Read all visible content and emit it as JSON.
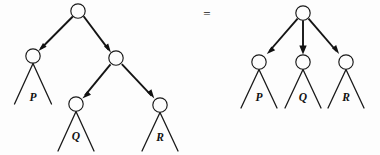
{
  "figure": {
    "background_color": "#fdfdfd",
    "ink_color": "#141414",
    "equals": {
      "text": "=",
      "x": 207,
      "y": 18
    },
    "left_tree": {
      "name": "binary-tree",
      "nodes": [
        {
          "id": "root",
          "label": "",
          "cx": 78,
          "cy": 11,
          "r": 7.2
        },
        {
          "id": "n-left",
          "label": "",
          "cx": 33,
          "cy": 56,
          "r": 7.2
        },
        {
          "id": "n-right",
          "label": "",
          "cx": 116,
          "cy": 58,
          "r": 7.2
        },
        {
          "id": "n-q",
          "label": "",
          "cx": 76,
          "cy": 104,
          "r": 7.2
        },
        {
          "id": "n-r",
          "label": "",
          "cx": 160,
          "cy": 105,
          "r": 7.2
        }
      ],
      "edges": [
        {
          "from": "root",
          "to": "n-left",
          "arrow": true
        },
        {
          "from": "root",
          "to": "n-right",
          "arrow": true
        },
        {
          "from": "n-right",
          "to": "n-q",
          "arrow": true
        },
        {
          "from": "n-right",
          "to": "n-r",
          "arrow": true
        }
      ],
      "subtrees": [
        {
          "label": "P",
          "apex_x": 33,
          "apex_y": 63,
          "base_y": 104,
          "half_width": 19,
          "label_x": 33,
          "label_y": 101
        },
        {
          "label": "Q",
          "apex_x": 76,
          "apex_y": 111,
          "base_y": 151,
          "half_width": 19,
          "label_x": 76,
          "label_y": 140
        },
        {
          "label": "R",
          "apex_x": 160,
          "apex_y": 112,
          "base_y": 151,
          "half_width": 19,
          "label_x": 160,
          "label_y": 141
        }
      ]
    },
    "right_tree": {
      "name": "multiway-tree",
      "nodes": [
        {
          "id": "root",
          "label": "",
          "cx": 303,
          "cy": 13,
          "r": 7.2
        },
        {
          "id": "c-p",
          "label": "",
          "cx": 259,
          "cy": 62,
          "r": 7.2
        },
        {
          "id": "c-q",
          "label": "",
          "cx": 303,
          "cy": 62,
          "r": 7.2
        },
        {
          "id": "c-r",
          "label": "",
          "cx": 346,
          "cy": 62,
          "r": 7.2
        }
      ],
      "edges": [
        {
          "from": "root",
          "to": "c-p",
          "arrow": true
        },
        {
          "from": "root",
          "to": "c-q",
          "arrow": true
        },
        {
          "from": "root",
          "to": "c-r",
          "arrow": true
        }
      ],
      "subtrees": [
        {
          "label": "P",
          "apex_x": 259,
          "apex_y": 69,
          "base_y": 108,
          "half_width": 19,
          "label_x": 259,
          "label_y": 101
        },
        {
          "label": "Q",
          "apex_x": 303,
          "apex_y": 69,
          "base_y": 108,
          "half_width": 19,
          "label_x": 303,
          "label_y": 101
        },
        {
          "label": "R",
          "apex_x": 346,
          "apex_y": 69,
          "base_y": 108,
          "half_width": 19,
          "label_x": 346,
          "label_y": 101
        }
      ]
    }
  }
}
